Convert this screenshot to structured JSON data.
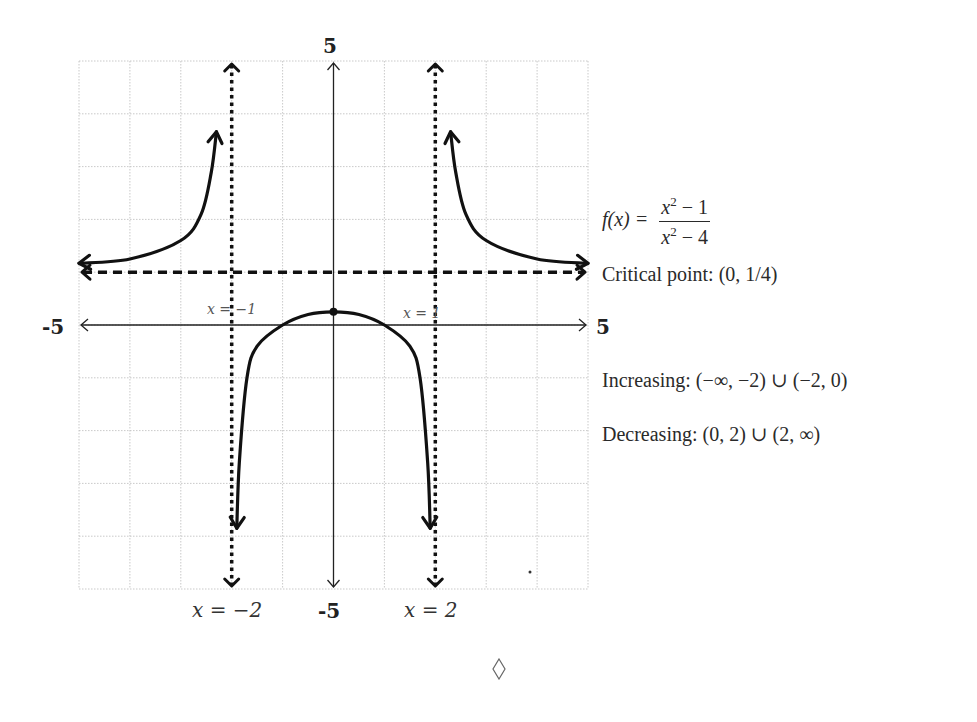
{
  "chart_data": {
    "type": "line",
    "title": "",
    "function": "f(x) = (x^2 - 1)/(x^2 - 4)",
    "xlim": [
      -5,
      5
    ],
    "ylim": [
      -5,
      5
    ],
    "grid": true,
    "grid_step": 1,
    "axis_labels": {
      "x_min": "-5",
      "x_max": "5",
      "y_max": "5",
      "y_min": "-5"
    },
    "vertical_asymptotes": [
      {
        "x": -2,
        "label": "x = −2"
      },
      {
        "x": 2,
        "label": "x = 2"
      }
    ],
    "horizontal_asymptote": {
      "y": 1
    },
    "x_intercepts": [
      {
        "x": -1,
        "label": "x = −1"
      },
      {
        "x": 1,
        "label": "x = 1"
      }
    ],
    "critical_point": {
      "x": 0,
      "y": 0.25,
      "label": "(0, 1/4)"
    },
    "series": [
      {
        "name": "left-branch",
        "x_range": [
          -5,
          -2.3
        ],
        "points": [
          [
            -5,
            1.17
          ],
          [
            -4,
            1.25
          ],
          [
            -3,
            1.6
          ],
          [
            -2.6,
            2.1
          ],
          [
            -2.4,
            2.9
          ],
          [
            -2.3,
            3.66
          ]
        ]
      },
      {
        "name": "middle-branch",
        "x_range": [
          -1.9,
          1.9
        ],
        "points": [
          [
            -1.9,
            -3.85
          ],
          [
            -1.85,
            -2.6
          ],
          [
            -1.7,
            -1.0
          ],
          [
            -1.5,
            -0.4
          ],
          [
            -1,
            0
          ],
          [
            -0.5,
            0.2
          ],
          [
            0,
            0.25
          ],
          [
            0.5,
            0.2
          ],
          [
            1,
            0
          ],
          [
            1.5,
            -0.4
          ],
          [
            1.7,
            -1.0
          ],
          [
            1.85,
            -2.6
          ],
          [
            1.9,
            -3.85
          ]
        ]
      },
      {
        "name": "right-branch",
        "x_range": [
          2.3,
          5
        ],
        "points": [
          [
            2.3,
            3.66
          ],
          [
            2.4,
            2.9
          ],
          [
            2.6,
            2.1
          ],
          [
            3,
            1.6
          ],
          [
            4,
            1.25
          ],
          [
            5,
            1.17
          ]
        ]
      }
    ]
  },
  "labels": {
    "y_top": "5",
    "y_bottom": "-5",
    "x_left": "-5",
    "x_right": "5",
    "va_left": "x = −2",
    "va_right": "x = 2",
    "xint_left": "x = −1",
    "xint_right": "x = 1"
  },
  "annotations": {
    "function_prefix": "f(x) =",
    "numerator": "x",
    "numerator_exp": "2",
    "numerator_rest": " − 1",
    "denominator": "x",
    "denominator_exp": "2",
    "denominator_rest": " − 4",
    "critical_point": "Critical point:  (0, 1/4)",
    "increasing": "Increasing:  (−∞, −2) ∪ (−2, 0)",
    "decreasing": "Decreasing:  (0, 2) ∪ (2, ∞)"
  },
  "footer": {
    "symbol": "◊"
  }
}
